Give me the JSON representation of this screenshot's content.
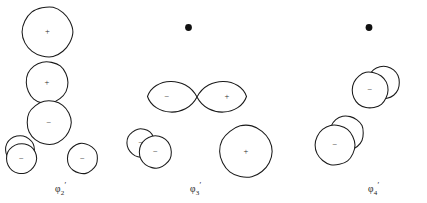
{
  "figure": {
    "background_color": "#ffffff",
    "stroke_color": "#1a1a1a",
    "width": 427,
    "height": 203
  },
  "panels": [
    {
      "id": "phi2",
      "label_base": "φ",
      "label_sub": "2",
      "label_prime": "′",
      "label_full": "φ₂′",
      "label_x": 55,
      "label_y": 181,
      "has_atom_dot": false,
      "shapes": [
        {
          "name": "orbital-lobe-top",
          "type": "circle",
          "cx": 47.5,
          "cy": 32.0,
          "r": 25.0,
          "sign": "+"
        },
        {
          "name": "orbital-lobe-upper-middle",
          "type": "circle",
          "cx": 47.0,
          "cy": 82.5,
          "r": 21.0,
          "sign": "+"
        },
        {
          "name": "orbital-lobe-lower-middle",
          "type": "circle",
          "cx": 49.0,
          "cy": 122.5,
          "r": 22.0,
          "sign": "−"
        },
        {
          "name": "orbital-lobe-back-left-small",
          "type": "circle",
          "cx": 20.0,
          "cy": 150.0,
          "r": 14.5,
          "sign": "−"
        },
        {
          "name": "orbital-lobe-front-left-small",
          "type": "circle",
          "cx": 21.5,
          "cy": 158.5,
          "r": 15.0,
          "sign": "−"
        },
        {
          "name": "orbital-lobe-bottom-right",
          "type": "circle",
          "cx": 82.5,
          "cy": 158.5,
          "r": 15.0,
          "sign": "−"
        }
      ]
    },
    {
      "id": "phi3",
      "label_base": "φ",
      "label_sub": "3",
      "label_prime": "′",
      "label_full": "φ₃′",
      "label_x": 190,
      "label_y": 181,
      "has_atom_dot": true,
      "atom_dot": {
        "name": "atom-dot-center-top",
        "cx": 188.5,
        "cy": 27.5,
        "r": 3.4
      },
      "shapes": [
        {
          "name": "orbital-lobe-figure-eight-left",
          "type": "teardrop",
          "tip_x": 197.0,
          "tip_y": 97.0,
          "cx": 172.5,
          "cy": 96.5,
          "rx": 25.0,
          "ry": 19.0,
          "sign": "−",
          "sign_x": 167.0,
          "sign_y": 97.0
        },
        {
          "name": "orbital-lobe-figure-eight-right",
          "type": "teardrop",
          "tip_x": 197.0,
          "tip_y": 97.0,
          "cx": 221.5,
          "cy": 96.5,
          "rx": 25.0,
          "ry": 19.0,
          "sign": "+",
          "sign_x": 227.0,
          "sign_y": 97.0
        },
        {
          "name": "orbital-lobe-back-left-small",
          "type": "circle",
          "cx": 141.0,
          "cy": 143.0,
          "r": 14.0,
          "sign": "−"
        },
        {
          "name": "orbital-lobe-front-left-small",
          "type": "circle",
          "cx": 155.5,
          "cy": 152.0,
          "r": 16.0,
          "sign": "−"
        },
        {
          "name": "orbital-lobe-bottom-right-large",
          "type": "circle",
          "cx": 246.0,
          "cy": 151.5,
          "r": 26.0,
          "sign": "+"
        }
      ]
    },
    {
      "id": "phi4",
      "label_base": "φ",
      "label_sub": "4",
      "label_prime": "′",
      "label_full": "φ₄′",
      "label_x": 368,
      "label_y": 181,
      "has_atom_dot": true,
      "atom_dot": {
        "name": "atom-dot-center-top",
        "cx": 369.0,
        "cy": 27.5,
        "r": 3.4
      },
      "shapes": [
        {
          "name": "orbital-lobe-upper-back",
          "type": "circle",
          "cx": 383.5,
          "cy": 82.5,
          "r": 16.0,
          "sign": "+"
        },
        {
          "name": "orbital-lobe-upper-front",
          "type": "circle",
          "cx": 370.0,
          "cy": 90.0,
          "r": 18.0,
          "sign": "−"
        },
        {
          "name": "orbital-lobe-lower-back",
          "type": "circle",
          "cx": 346.5,
          "cy": 133.0,
          "r": 17.0,
          "sign": "+"
        },
        {
          "name": "orbital-lobe-lower-front",
          "type": "circle",
          "cx": 335.0,
          "cy": 145.0,
          "r": 20.0,
          "sign": "−"
        }
      ]
    }
  ]
}
